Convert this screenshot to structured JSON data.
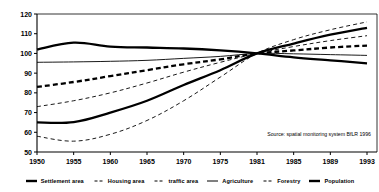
{
  "chart_data": {
    "type": "line",
    "title": "",
    "subtitle": "",
    "xlabel": "",
    "ylabel": "",
    "xlim": [
      1950,
      1993
    ],
    "ylim": [
      50,
      120
    ],
    "grid": false,
    "index_year": 1981,
    "index_value": 100,
    "legend_position": "bottom",
    "x": [
      1950,
      1955,
      1960,
      1965,
      1970,
      1975,
      1981,
      1985,
      1989,
      1993
    ],
    "xticklabels": [
      "1950",
      "1955",
      "1960",
      "1965",
      "1970",
      "1975",
      "1981",
      "1985",
      "1989",
      "1993"
    ],
    "yticks": [
      50,
      60,
      70,
      80,
      90,
      100,
      110,
      120
    ],
    "yticklabels": [
      "50",
      "60",
      "70",
      "80",
      "90",
      "100",
      "110",
      "120"
    ],
    "series": [
      {
        "name": "Settlement area",
        "style": "thick-solid",
        "color": "#000000",
        "values": [
          65.0,
          65.2,
          70.0,
          76.0,
          84.0,
          91.5,
          100.0,
          105.0,
          109.5,
          113.0
        ]
      },
      {
        "name": "Housing area",
        "style": "thick-dashed",
        "color": "#000000",
        "values": [
          83.0,
          85.5,
          88.5,
          91.5,
          94.5,
          97.0,
          100.0,
          101.5,
          103.0,
          104.0
        ]
      },
      {
        "name": "traffic area",
        "style": "thin-dashed",
        "color": "#000000",
        "values": [
          73.0,
          76.0,
          80.0,
          85.0,
          90.5,
          95.5,
          100.0,
          103.5,
          106.5,
          109.0
        ]
      },
      {
        "name": "Agriculture",
        "style": "thin-solid",
        "color": "#000000",
        "values": [
          95.5,
          95.7,
          96.0,
          96.5,
          97.5,
          98.5,
          100.0,
          99.8,
          99.4,
          99.0
        ]
      },
      {
        "name": "Forestry",
        "style": "thick-solid",
        "color": "#000000",
        "values": [
          102.0,
          105.5,
          103.5,
          103.0,
          102.5,
          101.5,
          100.0,
          98.0,
          96.5,
          95.0
        ]
      },
      {
        "name": "Population",
        "style": "thin-dashed",
        "color": "#000000",
        "values": [
          58.0,
          55.5,
          59.0,
          66.0,
          76.0,
          88.0,
          100.0,
          107.0,
          112.0,
          116.0
        ]
      }
    ]
  },
  "source": {
    "text": "Source: spatial monitoring system BfLR 1996"
  },
  "legend": {
    "items": [
      {
        "label": "Settlement area",
        "style": "thick-solid"
      },
      {
        "label": "Housing area",
        "style": "thin-dashed"
      },
      {
        "label": "traffic area",
        "style": "thin-dashed"
      },
      {
        "label": "Agriculture",
        "style": "thin-solid"
      },
      {
        "label": "Forestry",
        "style": "thin-dashed"
      },
      {
        "label": "Population",
        "style": "thick-solid"
      }
    ]
  },
  "colors": {
    "line": "#000000",
    "axis": "#000000",
    "background": "#ffffff"
  }
}
